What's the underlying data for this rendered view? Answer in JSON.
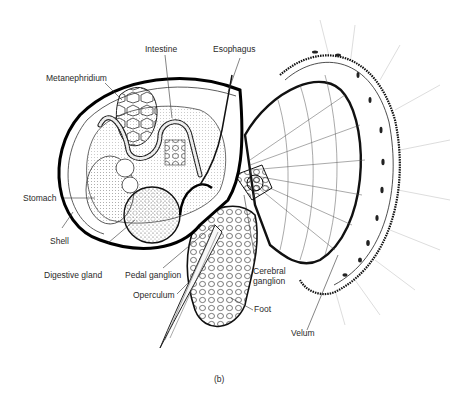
{
  "figure": {
    "caption": "(b)",
    "labels": {
      "intestine": "Intestine",
      "esophagus": "Esophagus",
      "metanephridium": "Metanephridium",
      "stomach": "Stomach",
      "shell": "Shell",
      "digestive_gland": "Digestive gland",
      "pedal_ganglion": "Pedal ganglion",
      "operculum": "Operculum",
      "cerebral_ganglion": "Cerebral\nganglion",
      "cerebral_ganglion_line1": "Cerebral",
      "cerebral_ganglion_line2": "ganglion",
      "foot": "Foot",
      "velum": "Velum"
    }
  }
}
